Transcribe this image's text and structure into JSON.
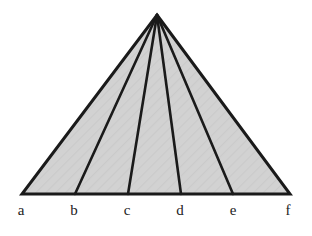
{
  "figure": {
    "background_color": "#ffffff",
    "fill_color": "#d0d0d0",
    "stroke_color": "#1a1a1a",
    "label_color": "#222222",
    "outline_width": 3,
    "cevian_width": 2.6,
    "apex": {
      "name": "apex",
      "x": 157,
      "y": 15
    },
    "baseline_y": 194,
    "vertices": [
      {
        "id": "a",
        "label": "a",
        "x": 22,
        "y": 194,
        "label_x": 21,
        "label_y": 203
      },
      {
        "id": "b",
        "label": "b",
        "x": 75,
        "y": 194,
        "label_x": 74,
        "label_y": 203
      },
      {
        "id": "c",
        "label": "c",
        "x": 128,
        "y": 194,
        "label_x": 127,
        "label_y": 203
      },
      {
        "id": "d",
        "label": "d",
        "x": 181,
        "y": 194,
        "label_x": 180,
        "label_y": 203
      },
      {
        "id": "e",
        "label": "e",
        "x": 233,
        "y": 194,
        "label_x": 233,
        "label_y": 203
      },
      {
        "id": "f",
        "label": "f",
        "x": 290,
        "y": 194,
        "label_x": 288,
        "label_y": 203
      }
    ],
    "cevians": [
      {
        "id": "cevian-b",
        "from": "apex",
        "to": "b"
      },
      {
        "id": "cevian-c",
        "from": "apex",
        "to": "c"
      },
      {
        "id": "cevian-d",
        "from": "apex",
        "to": "d"
      },
      {
        "id": "cevian-e",
        "from": "apex",
        "to": "e"
      }
    ],
    "regions": [
      {
        "id": "region-ab",
        "between": [
          "a",
          "b"
        ]
      },
      {
        "id": "region-bc",
        "between": [
          "b",
          "c"
        ]
      },
      {
        "id": "region-cd",
        "between": [
          "c",
          "d"
        ]
      },
      {
        "id": "region-de",
        "between": [
          "d",
          "e"
        ]
      },
      {
        "id": "region-ef",
        "between": [
          "e",
          "f"
        ]
      }
    ]
  }
}
